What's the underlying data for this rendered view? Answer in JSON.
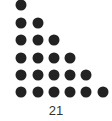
{
  "figure": {
    "type": "triangular-number-dot-pattern",
    "rows": [
      1,
      2,
      3,
      4,
      5,
      6
    ],
    "total_label": "21",
    "dot_color": "#222222"
  }
}
